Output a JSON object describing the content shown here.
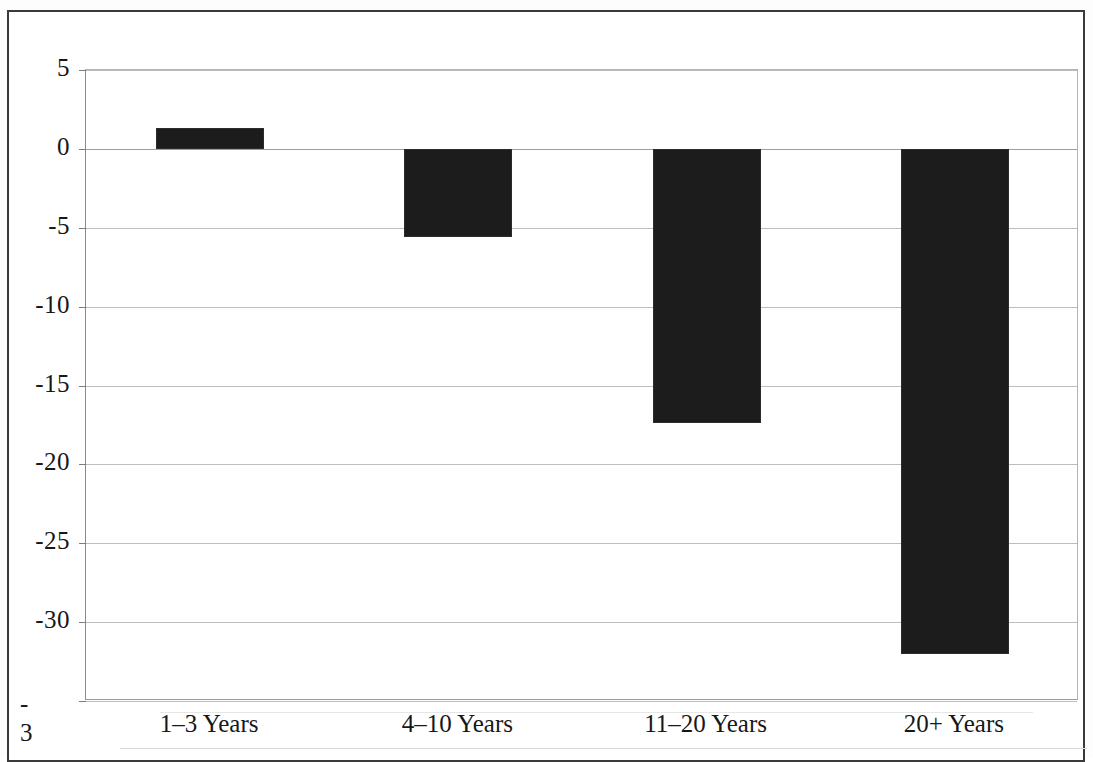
{
  "chart_data": {
    "type": "bar",
    "title": "",
    "subtitle": "",
    "xlabel": "",
    "ylabel": "",
    "categories": [
      "1–3 Years",
      "4–10 Years",
      "11–20 Years",
      "20+ Years"
    ],
    "values": [
      1.3,
      -5.6,
      -17.4,
      -32.0
    ],
    "series": [
      {
        "name": "",
        "values": [
          1.3,
          -5.6,
          -17.4,
          -32.0
        ]
      }
    ],
    "ylim": [
      -35,
      5
    ],
    "ytick_values": [
      5,
      0,
      -5,
      -10,
      -15,
      -20,
      -25,
      -30,
      -35
    ],
    "ytick_labels": [
      "5",
      "0",
      "-5",
      "-10",
      "-15",
      "-20",
      "-25",
      "-30",
      "-35"
    ],
    "bottom_tick_label_wrapped": [
      "-",
      "3"
    ],
    "grid": true,
    "grid_axis": "y",
    "legend": false,
    "legend_position": "none",
    "bar_color": "#1c1c1c",
    "gridline_color": "#bdbdbd",
    "axis_color": "#8a8a8a",
    "frame_color": "#3a3a3a",
    "background_color": "#ffffff"
  },
  "axis": {
    "y_labels": [
      {
        "text": "5",
        "value": 5
      },
      {
        "text": "0",
        "value": 0
      },
      {
        "text": "-5",
        "value": -5
      },
      {
        "text": "-10",
        "value": -10
      },
      {
        "text": "-15",
        "value": -15
      },
      {
        "text": "-20",
        "value": -20
      },
      {
        "text": "-25",
        "value": -25
      },
      {
        "text": "-30",
        "value": -30
      }
    ],
    "y_label_clipped_top": "-",
    "y_label_clipped_bottom": "3"
  }
}
